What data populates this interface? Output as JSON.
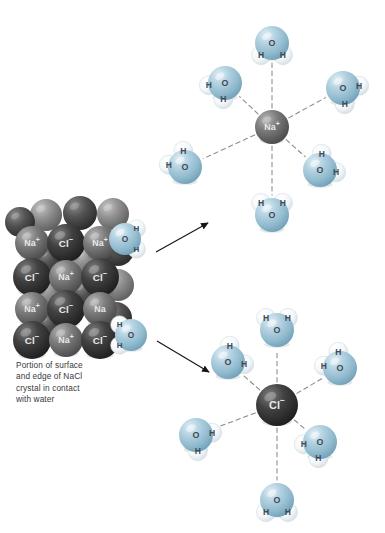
{
  "figure": {
    "caption": "Portion of surface and edge of NaCl crystal in contact with water",
    "caption_lines": [
      "Portion of surface",
      "and edge of NaCl",
      "crystal in contact",
      "with water"
    ]
  },
  "colors": {
    "background": "#ffffff",
    "sodium_ion": "#6b6b6b",
    "chloride_ion": "#3a3a3a",
    "crystal_cation": "#6f6f6f",
    "crystal_anion": "#3d3d3d",
    "oxygen": "#9cc0d4",
    "hydrogen": "#f2f6f8",
    "bond_dash": "#8a8a8a",
    "arrow": "#161616",
    "caption_text": "#3a3a3a",
    "ion_label_text": "#e9e9e9",
    "atom_label_text": "#3e4a52"
  },
  "labels": {
    "sodium": "Na",
    "sodium_charge": "+",
    "chloride": "Cl",
    "chloride_charge": "−",
    "oxygen": "O",
    "hydrogen": "H"
  },
  "crystal": {
    "name": "nacl-crystal-lattice",
    "description": "Space-filling model of a sodium chloride crystal surface and edge",
    "rows": [
      {
        "ions": [
          "Na",
          "Cl",
          "Na"
        ]
      },
      {
        "ions": [
          "Cl",
          "Na",
          "Cl"
        ]
      },
      {
        "ions": [
          "Na",
          "Cl",
          "Na"
        ]
      },
      {
        "ions": [
          "Cl",
          "Na",
          "Cl"
        ]
      }
    ],
    "front_ions": [
      {
        "id": "c-r0-0",
        "label": "Na",
        "charge": "+",
        "type": "cation",
        "cx": 32,
        "cy": 243,
        "r": 17
      },
      {
        "id": "c-r0-1",
        "label": "Cl",
        "charge": "−",
        "type": "anion",
        "cx": 66,
        "cy": 243,
        "r": 19
      },
      {
        "id": "c-r0-2",
        "label": "Na",
        "charge": "+",
        "type": "cation",
        "cx": 100,
        "cy": 243,
        "r": 17
      },
      {
        "id": "c-r1-0",
        "label": "Cl",
        "charge": "−",
        "type": "anion",
        "cx": 32,
        "cy": 277,
        "r": 19
      },
      {
        "id": "c-r1-1",
        "label": "Na",
        "charge": "+",
        "type": "cation",
        "cx": 66,
        "cy": 277,
        "r": 17
      },
      {
        "id": "c-r1-2",
        "label": "Cl",
        "charge": "−",
        "type": "anion",
        "cx": 100,
        "cy": 277,
        "r": 19
      },
      {
        "id": "c-r2-0",
        "label": "Na",
        "charge": "+",
        "type": "cation",
        "cx": 32,
        "cy": 309,
        "r": 17
      },
      {
        "id": "c-r2-1",
        "label": "Cl",
        "charge": "−",
        "type": "anion",
        "cx": 66,
        "cy": 309,
        "r": 19
      },
      {
        "id": "c-r2-2",
        "label": "Na",
        "charge": "",
        "type": "cation",
        "cx": 100,
        "cy": 309,
        "r": 17
      },
      {
        "id": "c-r3-0",
        "label": "Cl",
        "charge": "−",
        "type": "anion",
        "cx": 32,
        "cy": 340,
        "r": 19
      },
      {
        "id": "c-r3-1",
        "label": "Na",
        "charge": "+",
        "type": "cation",
        "cx": 66,
        "cy": 340,
        "r": 17
      },
      {
        "id": "c-r3-2",
        "label": "Cl",
        "charge": "−",
        "type": "anion",
        "cx": 100,
        "cy": 340,
        "r": 19
      }
    ],
    "back_ions": [
      {
        "id": "b-0",
        "cx": 46,
        "cy": 215,
        "r": 16,
        "type": "cation"
      },
      {
        "id": "b-1",
        "cx": 80,
        "cy": 213,
        "r": 17,
        "type": "anion"
      },
      {
        "id": "b-2",
        "cx": 113,
        "cy": 214,
        "r": 16,
        "type": "cation"
      },
      {
        "id": "b-3",
        "cx": 20,
        "cy": 222,
        "r": 15,
        "type": "anion"
      },
      {
        "id": "b-4",
        "cx": 118,
        "cy": 250,
        "r": 16,
        "type": "anion"
      },
      {
        "id": "b-5",
        "cx": 118,
        "cy": 285,
        "r": 16,
        "type": "cation"
      },
      {
        "id": "b-6",
        "cx": 116,
        "cy": 318,
        "r": 16,
        "type": "anion"
      },
      {
        "id": "b-7",
        "cx": 48,
        "cy": 260,
        "r": 15,
        "type": "anion"
      },
      {
        "id": "b-8",
        "cx": 84,
        "cy": 260,
        "r": 15,
        "type": "cation"
      },
      {
        "id": "b-9",
        "cx": 48,
        "cy": 293,
        "r": 15,
        "type": "cation"
      },
      {
        "id": "b-10",
        "cx": 84,
        "cy": 293,
        "r": 15,
        "type": "anion"
      },
      {
        "id": "b-11",
        "cx": 48,
        "cy": 325,
        "r": 15,
        "type": "anion"
      }
    ],
    "attached_waters": [
      {
        "id": "crystal-water-top",
        "note": "Water molecule with oxygen facing the crystal surface sodium ion",
        "ox": 125,
        "oy": 239,
        "orient": "H-right"
      },
      {
        "id": "crystal-water-bottom",
        "note": "Water molecule with hydrogens facing the crystal edge chloride ion",
        "ox": 131,
        "oy": 335,
        "orient": "H-left"
      }
    ]
  },
  "arrows": [
    {
      "id": "arrow-to-sodium-shell",
      "label": "",
      "from": {
        "x": 156,
        "y": 252
      },
      "to": {
        "x": 208,
        "y": 223
      }
    },
    {
      "id": "arrow-to-chloride-shell",
      "label": "",
      "from": {
        "x": 157,
        "y": 341
      },
      "to": {
        "x": 209,
        "y": 372
      }
    }
  ],
  "hydration_shells": [
    {
      "id": "sodium-hydration-shell",
      "ion": {
        "label": "Na",
        "charge": "+",
        "type": "cation",
        "cx": 272,
        "cy": 127,
        "r": 17
      },
      "orientation_rule": "oxygen-toward-ion",
      "water_count": 6,
      "waters": [
        {
          "id": "na-w-top",
          "ox": 272,
          "oy": 43,
          "orient": "H-up",
          "angle": 90
        },
        {
          "id": "na-w-upper-left",
          "ox": 225,
          "oy": 83,
          "orient": "H-upleft",
          "angle": 140
        },
        {
          "id": "na-w-upper-right",
          "ox": 343,
          "oy": 88,
          "orient": "H-upright",
          "angle": 40
        },
        {
          "id": "na-w-lower-left",
          "ox": 185,
          "oy": 167,
          "orient": "H-downleft",
          "angle": 215
        },
        {
          "id": "na-w-lower-right",
          "ox": 320,
          "oy": 170,
          "orient": "H-downright",
          "angle": 325
        },
        {
          "id": "na-w-bottom",
          "ox": 272,
          "oy": 215,
          "orient": "H-down",
          "angle": 270
        }
      ]
    },
    {
      "id": "chloride-hydration-shell",
      "ion": {
        "label": "Cl",
        "charge": "−",
        "type": "anion",
        "cx": 277,
        "cy": 405,
        "r": 21
      },
      "orientation_rule": "hydrogen-toward-ion",
      "water_count": 6,
      "waters": [
        {
          "id": "cl-w-top",
          "ox": 277,
          "oy": 330,
          "orient": "H-down",
          "angle": 90
        },
        {
          "id": "cl-w-upper-left",
          "ox": 228,
          "oy": 362,
          "orient": "H-downright",
          "angle": 140
        },
        {
          "id": "cl-w-upper-right",
          "ox": 340,
          "oy": 368,
          "orient": "H-downleft",
          "angle": 40
        },
        {
          "id": "cl-w-lower-left",
          "ox": 196,
          "oy": 435,
          "orient": "H-upright",
          "angle": 215
        },
        {
          "id": "cl-w-lower-right",
          "ox": 320,
          "oy": 442,
          "orient": "H-upleft",
          "angle": 325
        },
        {
          "id": "cl-w-bottom",
          "ox": 277,
          "oy": 500,
          "orient": "H-up",
          "angle": 270
        }
      ]
    }
  ]
}
